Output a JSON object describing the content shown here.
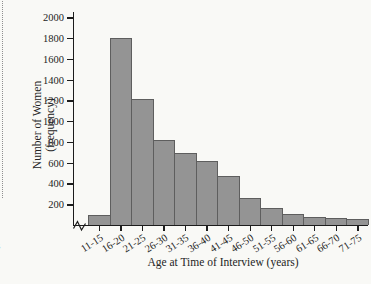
{
  "page": {
    "left_margin_fragments": [
      "f",
      "s"
    ]
  },
  "chart_data": {
    "type": "bar",
    "title": "",
    "xlabel": "Age at Time of Interview (years)",
    "ylabel": "Number of Women (frequency)",
    "ylabel_lines": [
      "Number of Women",
      "(frequency)"
    ],
    "categories": [
      "11-15",
      "16-20",
      "21-25",
      "26-30",
      "31-35",
      "36-40",
      "41-45",
      "46-50",
      "51-55",
      "56-60",
      "61-65",
      "66-70",
      "71-75"
    ],
    "values": [
      100,
      1800,
      1210,
      820,
      690,
      620,
      470,
      260,
      160,
      110,
      80,
      70,
      60
    ],
    "yticks": [
      200,
      400,
      600,
      800,
      1000,
      1200,
      1400,
      1600,
      1800,
      2000
    ],
    "ylim": [
      0,
      2050
    ],
    "grid": false,
    "legend": "none",
    "x_axis_break": true,
    "bar_color": "#949494",
    "bar_edge_color": "#5e5e5e",
    "axis_color": "#1c1c1c"
  }
}
